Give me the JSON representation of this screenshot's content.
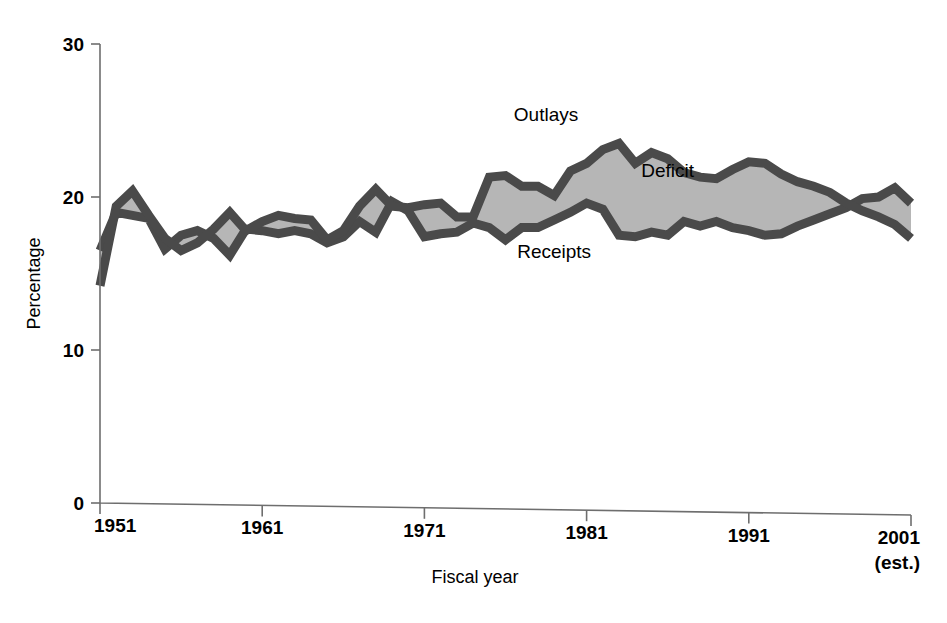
{
  "chart_data": {
    "type": "area",
    "title": "",
    "subtitle": "",
    "xlabel": "Fiscal year",
    "ylabel": "Percentage",
    "xlim": [
      1951,
      2001
    ],
    "ylim": [
      0,
      30
    ],
    "yticks": [
      0,
      10,
      20,
      30
    ],
    "ytick_labels": [
      "0",
      "10",
      "20",
      "30"
    ],
    "xticks": [
      1951,
      1961,
      1971,
      1981,
      1991,
      2001
    ],
    "xtick_labels": [
      "1951",
      "1961",
      "1971",
      "1981",
      "1991",
      "2001"
    ],
    "xtick_sublabels": [
      "",
      "",
      "",
      "",
      "",
      "(est.)"
    ],
    "grid": false,
    "legend_position": "inline-annotations",
    "annotations": [
      {
        "text": "Outlays",
        "x": 1978.5,
        "y": 25.0
      },
      {
        "text": "Deficit",
        "x": 1986.0,
        "y": 21.3
      },
      {
        "text": "Receipts",
        "x": 1979.0,
        "y": 16.0
      }
    ],
    "fill_label": "Deficit",
    "x": [
      1951,
      1952,
      1953,
      1954,
      1955,
      1956,
      1957,
      1958,
      1959,
      1960,
      1961,
      1962,
      1963,
      1964,
      1965,
      1966,
      1967,
      1968,
      1969,
      1970,
      1971,
      1972,
      1973,
      1974,
      1975,
      1976,
      1977,
      1978,
      1979,
      1980,
      1981,
      1982,
      1983,
      1984,
      1985,
      1986,
      1987,
      1988,
      1989,
      1990,
      1991,
      1992,
      1993,
      1994,
      1995,
      1996,
      1997,
      1998,
      1999,
      2000,
      2001
    ],
    "series": [
      {
        "name": "Outlays",
        "values": [
          14.2,
          19.4,
          20.4,
          18.8,
          17.3,
          16.5,
          17.0,
          17.9,
          19.0,
          17.8,
          18.4,
          18.8,
          18.6,
          18.5,
          17.2,
          17.8,
          19.4,
          20.5,
          19.4,
          19.3,
          19.5,
          19.6,
          18.7,
          18.7,
          21.3,
          21.4,
          20.7,
          20.7,
          20.1,
          21.7,
          22.2,
          23.1,
          23.5,
          22.2,
          22.9,
          22.5,
          21.6,
          21.3,
          21.2,
          21.8,
          22.3,
          22.2,
          21.5,
          21.0,
          20.7,
          20.3,
          19.6,
          19.1,
          18.7,
          18.2,
          17.3
        ],
        "color": "#4a4a4a",
        "linewidth": 9
      },
      {
        "name": "Receipts",
        "values": [
          16.5,
          19.0,
          18.8,
          18.6,
          16.6,
          17.5,
          17.8,
          17.3,
          16.2,
          17.9,
          17.8,
          17.6,
          17.8,
          17.6,
          17.0,
          17.4,
          18.4,
          17.7,
          19.7,
          19.1,
          17.4,
          17.6,
          17.7,
          18.3,
          18.0,
          17.2,
          18.0,
          18.0,
          18.5,
          19.0,
          19.6,
          19.2,
          17.5,
          17.4,
          17.7,
          17.5,
          18.4,
          18.1,
          18.4,
          18.0,
          17.8,
          17.5,
          17.6,
          18.1,
          18.5,
          18.9,
          19.3,
          19.9,
          20.0,
          20.6,
          19.6
        ],
        "color": "#4a4a4a",
        "linewidth": 9
      }
    ],
    "fill_color": "#b6b6b6",
    "fill_between": [
      "Outlays",
      "Receipts"
    ]
  },
  "axis": {
    "y_title": "Percentage",
    "x_title": "Fiscal year"
  }
}
